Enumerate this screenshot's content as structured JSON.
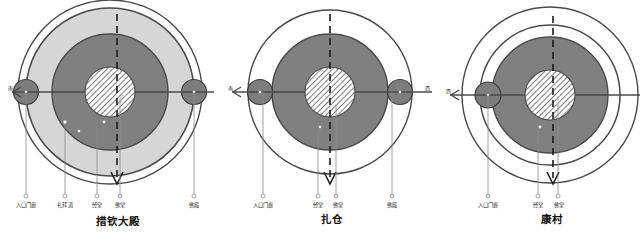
{
  "figure": {
    "kind": "architectural-plan-diagram",
    "colors": {
      "outer_ring_stroke": "#4a4a4a",
      "mid_ring_fill": "#d6d6d6",
      "inner_ring_fill": "#808080",
      "core_fill": "#ffffff",
      "core_hatch": "#555555",
      "node_fill": "#7d7d7d",
      "axis_line": "#4a4a4a",
      "leader_line": "#8a8a8a",
      "text": "#2b2b2b"
    }
  },
  "diagrams": [
    {
      "id": "tsokchen",
      "title": "措钦大殿",
      "direction_label": "南",
      "direction_side": "left",
      "zones": [
        {
          "name": "outer-boundary-circle",
          "r": 92
        },
        {
          "name": "outer-ring-light",
          "r": 84,
          "fill": "#d6d6d6"
        },
        {
          "name": "inner-ring-dark",
          "r": 58,
          "fill": "#808080"
        },
        {
          "name": "core-hatched",
          "r": 25
        }
      ],
      "nodes": [
        {
          "name": "entrance-node-left",
          "cx": -84,
          "r": 12
        },
        {
          "name": "shrine-node-right",
          "cx": 84,
          "r": 12
        }
      ],
      "callouts": [
        {
          "label": "入口门廊",
          "x": -84
        },
        {
          "label": "礼拜道",
          "x": -45
        },
        {
          "label": "经堂",
          "x": -13
        },
        {
          "label": "佛堂",
          "x": 10
        },
        {
          "label": "佛殿",
          "x": 84
        }
      ]
    },
    {
      "id": "dratsang",
      "title": "扎仓",
      "direction_label": "南",
      "direction_side": "left",
      "direction_label_right": "西",
      "zones": [
        {
          "name": "outer-boundary-circle",
          "r": 82
        },
        {
          "name": "outer-ring-light",
          "r": 78,
          "fill": "#ffffff"
        },
        {
          "name": "inner-ring-dark",
          "r": 58,
          "fill": "#808080"
        },
        {
          "name": "core-hatched",
          "r": 25
        }
      ],
      "nodes": [
        {
          "name": "entrance-node-left",
          "cx": -70,
          "r": 12
        },
        {
          "name": "shrine-node-right",
          "cx": 70,
          "r": 12
        }
      ],
      "callouts": [
        {
          "label": "入口门廊",
          "x": -70
        },
        {
          "label": "经堂",
          "x": -13
        },
        {
          "label": "佛堂",
          "x": 10
        },
        {
          "label": "佛殿",
          "x": 70
        }
      ]
    },
    {
      "id": "khangtsen",
      "title": "康村",
      "direction_label": "西",
      "direction_side": "left",
      "zones": [
        {
          "name": "outer-boundary-circle",
          "r": 88
        },
        {
          "name": "outer-ring-light",
          "r": 80,
          "fill": "#ffffff"
        },
        {
          "name": "inner-ring-dark",
          "r": 58,
          "fill": "#808080"
        },
        {
          "name": "core-hatched",
          "r": 25
        }
      ],
      "nodes": [
        {
          "name": "entrance-node-left",
          "cx": -76,
          "r": 12
        }
      ],
      "callouts": [
        {
          "label": "入口门廊",
          "x": -76
        },
        {
          "label": "经堂",
          "x": -13
        },
        {
          "label": "佛堂",
          "x": 10
        }
      ]
    }
  ]
}
